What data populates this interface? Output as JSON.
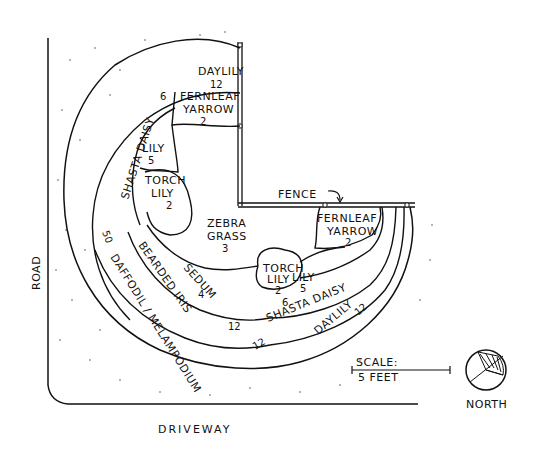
{
  "diagram": {
    "boundaries": {
      "road": "ROAD",
      "driveway": "DRIVEWAY",
      "fence": "FENCE"
    },
    "beds": [
      {
        "id": "daylily-top",
        "name": "DAYLILY",
        "count": "12"
      },
      {
        "id": "fernleaf-yarrow-top",
        "name_line1": "FERNLEAF",
        "name_line2": "YARROW",
        "count": "2"
      },
      {
        "id": "shasta-daisy-left",
        "name": "SHASTA DAISY",
        "count": "6"
      },
      {
        "id": "lily-left",
        "name": "LILY",
        "count": "5"
      },
      {
        "id": "torch-lily-left",
        "name_line1": "TORCH",
        "name_line2": "LILY",
        "count": "2"
      },
      {
        "id": "zebra-grass",
        "name_line1": "ZEBRA",
        "name_line2": "GRASS",
        "count": "3"
      },
      {
        "id": "fernleaf-yarrow-right",
        "name_line1": "FERNLEAF",
        "name_line2": "YARROW",
        "count": "2"
      },
      {
        "id": "torch-lily-right",
        "name_line1": "TORCH",
        "name_line2": "LILY",
        "count": "2"
      },
      {
        "id": "lily-right",
        "name": "LILY",
        "count": "5"
      },
      {
        "id": "shasta-daisy-right",
        "name": "SHASTA DAISY",
        "count": "6"
      },
      {
        "id": "daylily-right",
        "name": "DAYLILY",
        "count": "12"
      },
      {
        "id": "sedum",
        "name": "SEDUM",
        "count": "4"
      },
      {
        "id": "bearded-iris",
        "name": "BEARDED IRIS",
        "count": "12"
      },
      {
        "id": "daffodil-melampodium",
        "name": "DAFFODIL / MELAMPODIUM",
        "count_daffodil": "50",
        "count_melampodium": "12"
      }
    ],
    "scale": {
      "label_line1": "SCALE:",
      "label_line2": "5 FEET"
    },
    "compass": {
      "label": "NORTH"
    }
  }
}
